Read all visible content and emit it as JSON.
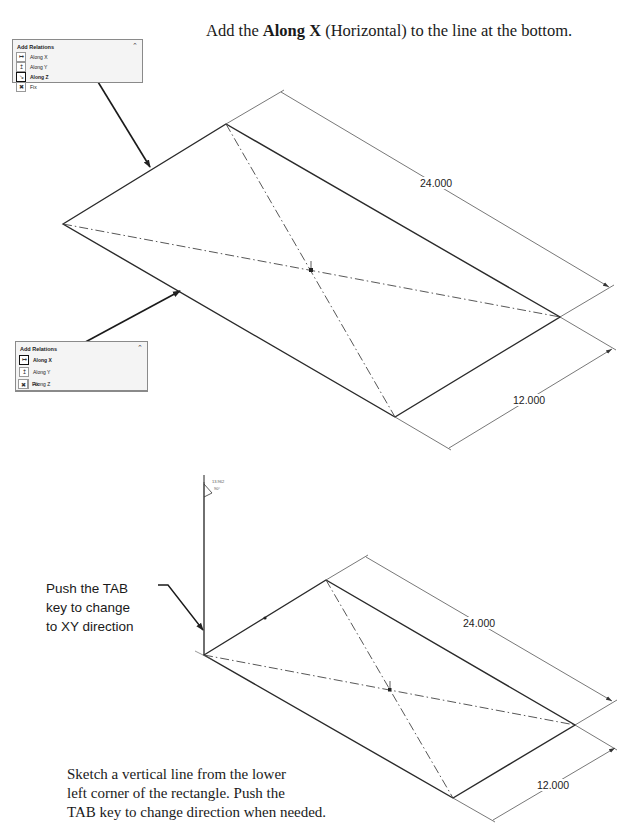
{
  "instruction": {
    "prefix": "Add the ",
    "bold": "Along X",
    "suffix": " (Horizontal) to the line at the bottom."
  },
  "top_panel": {
    "title": "Add Relations",
    "collapse_icon": "chevron-up-icon",
    "items": [
      {
        "label": "Along X",
        "icon": "along-x-icon",
        "selected": false
      },
      {
        "label": "Along Y",
        "icon": "along-y-icon",
        "selected": false
      },
      {
        "label": "Along Z",
        "icon": "along-z-icon",
        "selected": true
      },
      {
        "label": "Fix",
        "icon": "fix-icon",
        "selected": false
      }
    ]
  },
  "bottom_panel": {
    "title": "Add Relations",
    "collapse_icon": "chevron-up-icon",
    "items": [
      {
        "label": "Along X",
        "icon": "along-x-icon",
        "selected": true
      },
      {
        "label": "Along Y",
        "icon": "along-y-icon",
        "selected": false
      },
      {
        "label": "Along Z",
        "icon": "along-z-icon",
        "selected": false
      },
      {
        "label": "Fix",
        "icon": "fix-icon",
        "selected": false
      }
    ]
  },
  "top_drawing": {
    "dim_length": "24.000",
    "dim_width": "12.000"
  },
  "bottom_drawing": {
    "dim_length": "24.000",
    "dim_width": "12.000",
    "line_length_readout": "13.962",
    "angle_readout": "90°"
  },
  "callout": {
    "lines": [
      "Push the TAB",
      "key to change",
      "to XY direction"
    ]
  },
  "caption": {
    "lines": [
      "Sketch a vertical line from the lower",
      "left corner of the rectangle. Push the",
      "TAB key to change direction when needed."
    ]
  }
}
